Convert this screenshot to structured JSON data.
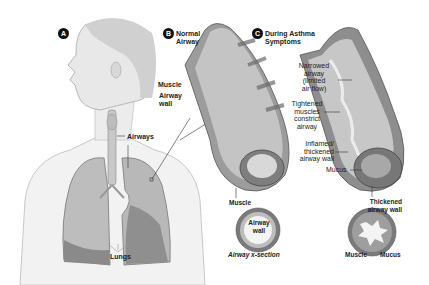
{
  "panels": {
    "a": {
      "badge": "A",
      "labels": {
        "airways": "Airways",
        "lungs": "Lungs"
      }
    },
    "b": {
      "badge": "B",
      "title_line1": "Normal",
      "title_line2": "Airway",
      "labels": {
        "muscle": "Muscle",
        "airway_wall_1": "Airway",
        "airway_wall_2": "wall"
      },
      "cross_section": {
        "muscle": "Muscle",
        "wall_1": "Airway",
        "wall_2": "wall",
        "caption": "Airway x-section"
      }
    },
    "c": {
      "badge": "C",
      "title_line1": "During Asthma",
      "title_line2": "Symptoms",
      "labels": {
        "narrowed_1": "Narrowed",
        "narrowed_2": "airway",
        "narrowed_3": "(limited",
        "narrowed_4": "air flow)",
        "tightened_1": "Tightened",
        "tightened_2": "muscles",
        "tightened_3": "constrict",
        "tightened_4": "airway",
        "inflamed_1": "Inflamed/",
        "inflamed_2": "thickened",
        "inflamed_3": "airway wall",
        "mucus": "Mucus"
      },
      "cross_section": {
        "thick_1": "Thickened",
        "thick_2": "airway wall",
        "muscle": "Muscle",
        "mucus": "Mucus"
      }
    }
  }
}
